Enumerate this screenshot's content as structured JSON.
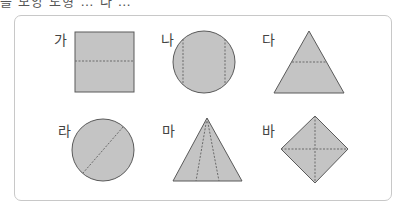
{
  "header_fragment": "쓸 모양 도형 … 나 …",
  "colors": {
    "fill": "#c4c4c4",
    "stroke": "#5a5a5a",
    "dash": "#6a6a6a",
    "frame": "#c8c8c8",
    "label": "#444444"
  },
  "shapes": [
    {
      "label": "가",
      "type": "square",
      "fold": "horizontal dashed line through middle"
    },
    {
      "label": "나",
      "type": "circle",
      "fold": "two vertical dashed lines"
    },
    {
      "label": "다",
      "type": "triangle",
      "fold": "horizontal dashed line"
    },
    {
      "label": "라",
      "type": "circle",
      "fold": "diagonal dashed line through center"
    },
    {
      "label": "마",
      "type": "triangle",
      "fold": "two dashed lines from apex to base"
    },
    {
      "label": "바",
      "type": "diamond",
      "fold": "vertical and horizontal dashed lines"
    }
  ]
}
